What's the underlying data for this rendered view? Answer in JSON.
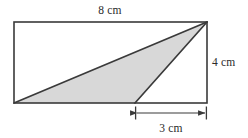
{
  "figure": {
    "background_color": "#ffffff",
    "stroke_color": "#3a3a3a",
    "shade_color": "#d8d8d8",
    "text_color": "#2b2b2b",
    "units": "cm",
    "rectangle": {
      "name": "outer-rectangle",
      "width_label": "8 cm",
      "height_label": "4 cm",
      "width_value": 8,
      "height_value": 4,
      "px": {
        "left": 14,
        "top": 22,
        "right": 207,
        "bottom": 103
      }
    },
    "triangle": {
      "name": "shaded-triangle",
      "base_label": "3 cm",
      "base_value": 3,
      "filled": true,
      "vertices_px": [
        {
          "label": "bottom-left",
          "x": 14,
          "y": 103
        },
        {
          "label": "apex-top-right",
          "x": 207,
          "y": 22
        },
        {
          "label": "base-left-on-bottom-edge",
          "x": 135,
          "y": 103
        }
      ]
    },
    "labels": {
      "top": "8 cm",
      "right": "4 cm",
      "bottom": "3 cm"
    },
    "dimension_line": {
      "name": "base-dimension-line",
      "label": "3 cm",
      "from_x": 135,
      "to_x": 207,
      "y": 113,
      "has_arrowheads": true,
      "has_end_ticks": true
    }
  }
}
